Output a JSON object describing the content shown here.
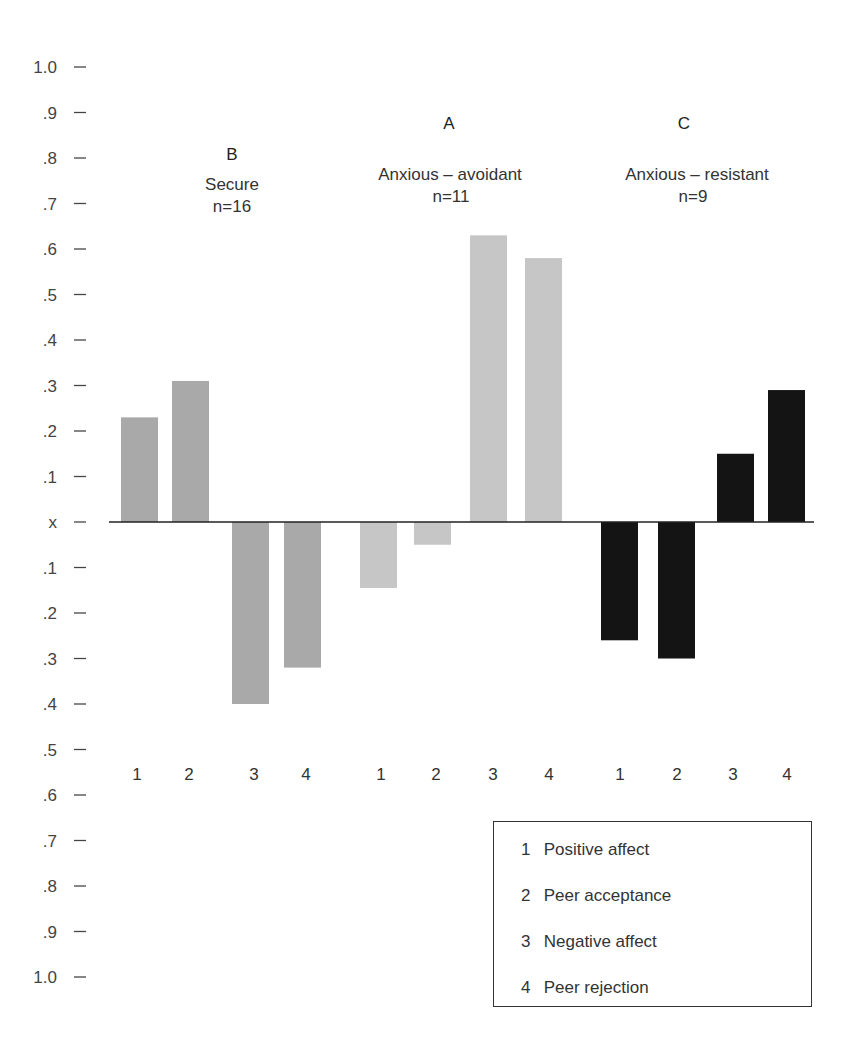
{
  "chart_data": {
    "type": "bar",
    "title": "",
    "xlabel": "",
    "ylabel": "",
    "ylim": [
      -1.0,
      1.0
    ],
    "grid": false,
    "y_ticks": [
      {
        "value": 1.0,
        "label": "1.0"
      },
      {
        "value": 0.9,
        "label": ".9"
      },
      {
        "value": 0.8,
        "label": ".8"
      },
      {
        "value": 0.7,
        "label": ".7"
      },
      {
        "value": 0.6,
        "label": ".6"
      },
      {
        "value": 0.5,
        "label": ".5"
      },
      {
        "value": 0.4,
        "label": ".4"
      },
      {
        "value": 0.3,
        "label": ".3"
      },
      {
        "value": 0.2,
        "label": ".2"
      },
      {
        "value": 0.1,
        "label": ".1"
      },
      {
        "value": 0.0,
        "label": "x"
      },
      {
        "value": -0.1,
        "label": ".1"
      },
      {
        "value": -0.2,
        "label": ".2"
      },
      {
        "value": -0.3,
        "label": ".3"
      },
      {
        "value": -0.4,
        "label": ".4"
      },
      {
        "value": -0.5,
        "label": ".5"
      },
      {
        "value": -0.6,
        "label": ".6"
      },
      {
        "value": -0.7,
        "label": ".7"
      },
      {
        "value": -0.8,
        "label": ".8"
      },
      {
        "value": -0.9,
        "label": ".9"
      },
      {
        "value": -1.0,
        "label": "1.0"
      }
    ],
    "categories": [
      "1",
      "2",
      "3",
      "4"
    ],
    "groups": [
      {
        "letter": "B",
        "name": "Secure",
        "n_label": "n=16",
        "color": "#a9a9a9",
        "values": [
          0.23,
          0.31,
          -0.4,
          -0.32
        ]
      },
      {
        "letter": "A",
        "name": "Anxious – avoidant",
        "n_label": "n=11",
        "color": "#c6c6c6",
        "values": [
          -0.145,
          -0.05,
          0.63,
          0.58
        ]
      },
      {
        "letter": "C",
        "name": "Anxious – resistant",
        "n_label": "n=9",
        "color": "#141414",
        "values": [
          -0.26,
          -0.3,
          0.15,
          0.29
        ]
      }
    ],
    "legend": {
      "placement": "bottom-right",
      "entries": [
        {
          "num": "1",
          "label": "Positive affect"
        },
        {
          "num": "2",
          "label": "Peer acceptance"
        },
        {
          "num": "3",
          "label": "Negative affect"
        },
        {
          "num": "4",
          "label": "Peer rejection"
        }
      ]
    }
  }
}
